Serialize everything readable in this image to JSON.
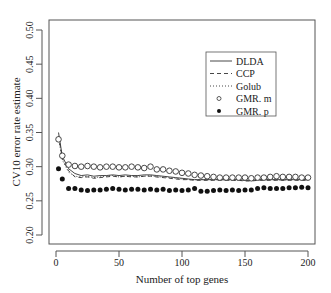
{
  "chart_data": {
    "type": "line",
    "title": "",
    "xlabel": "Number of top genes",
    "ylabel": "CV10 error rate estimate",
    "xlim": [
      0,
      200
    ],
    "ylim": [
      0.2,
      0.5
    ],
    "xticks": [
      0,
      50,
      100,
      150,
      200
    ],
    "yticks": [
      "0.20",
      "0.25",
      "0.30",
      "0.35",
      "0.40",
      "0.45",
      "0.50"
    ],
    "grid": false,
    "legend_position": "upper right",
    "legend": [
      {
        "name": "DLDA",
        "style": "solid"
      },
      {
        "name": "CCP",
        "style": "dashed"
      },
      {
        "name": "Golub",
        "style": "dotted"
      },
      {
        "name": "GMR. m",
        "style": "open-circle"
      },
      {
        "name": "GMR. p",
        "style": "filled-circle"
      }
    ],
    "x": [
      2,
      5,
      10,
      15,
      20,
      25,
      30,
      35,
      40,
      45,
      50,
      55,
      60,
      65,
      70,
      75,
      80,
      85,
      90,
      95,
      100,
      105,
      110,
      115,
      120,
      125,
      130,
      135,
      140,
      145,
      150,
      155,
      160,
      165,
      170,
      175,
      180,
      185,
      190,
      195,
      200
    ],
    "series": [
      {
        "name": "DLDA",
        "values": [
          0.35,
          0.315,
          0.297,
          0.29,
          0.287,
          0.288,
          0.286,
          0.287,
          0.287,
          0.288,
          0.287,
          0.288,
          0.287,
          0.287,
          0.288,
          0.288,
          0.287,
          0.286,
          0.285,
          0.284,
          0.283,
          0.282,
          0.281,
          0.281,
          0.281,
          0.281,
          0.281,
          0.281,
          0.281,
          0.281,
          0.28,
          0.28,
          0.281,
          0.281,
          0.281,
          0.281,
          0.281,
          0.281,
          0.281,
          0.281,
          0.281
        ]
      },
      {
        "name": "CCP",
        "values": [
          0.345,
          0.312,
          0.294,
          0.285,
          0.284,
          0.285,
          0.283,
          0.284,
          0.285,
          0.286,
          0.285,
          0.286,
          0.285,
          0.285,
          0.286,
          0.286,
          0.285,
          0.284,
          0.283,
          0.282,
          0.281,
          0.281,
          0.28,
          0.28,
          0.28,
          0.28,
          0.28,
          0.28,
          0.28,
          0.28,
          0.279,
          0.279,
          0.28,
          0.28,
          0.28,
          0.28,
          0.28,
          0.28,
          0.28,
          0.28,
          0.28
        ]
      },
      {
        "name": "Golub",
        "values": [
          0.342,
          0.31,
          0.292,
          0.286,
          0.285,
          0.286,
          0.284,
          0.285,
          0.286,
          0.287,
          0.285,
          0.286,
          0.286,
          0.285,
          0.286,
          0.287,
          0.285,
          0.285,
          0.284,
          0.283,
          0.282,
          0.281,
          0.281,
          0.281,
          0.281,
          0.281,
          0.281,
          0.28,
          0.28,
          0.28,
          0.28,
          0.28,
          0.28,
          0.281,
          0.281,
          0.281,
          0.28,
          0.281,
          0.281,
          0.281,
          0.281
        ]
      },
      {
        "name": "GMR. m",
        "values": [
          0.34,
          0.316,
          0.303,
          0.301,
          0.3,
          0.301,
          0.3,
          0.299,
          0.3,
          0.3,
          0.299,
          0.299,
          0.3,
          0.299,
          0.298,
          0.3,
          0.296,
          0.296,
          0.294,
          0.293,
          0.291,
          0.29,
          0.288,
          0.287,
          0.286,
          0.285,
          0.284,
          0.284,
          0.284,
          0.284,
          0.284,
          0.283,
          0.284,
          0.284,
          0.285,
          0.286,
          0.285,
          0.285,
          0.285,
          0.284,
          0.284
        ]
      },
      {
        "name": "GMR. p",
        "values": [
          0.297,
          0.282,
          0.268,
          0.268,
          0.266,
          0.265,
          0.266,
          0.266,
          0.267,
          0.268,
          0.267,
          0.266,
          0.267,
          0.267,
          0.266,
          0.267,
          0.266,
          0.267,
          0.265,
          0.266,
          0.265,
          0.266,
          0.268,
          0.264,
          0.264,
          0.265,
          0.266,
          0.265,
          0.266,
          0.265,
          0.266,
          0.266,
          0.268,
          0.269,
          0.268,
          0.268,
          0.268,
          0.269,
          0.269,
          0.27,
          0.269
        ]
      }
    ]
  }
}
